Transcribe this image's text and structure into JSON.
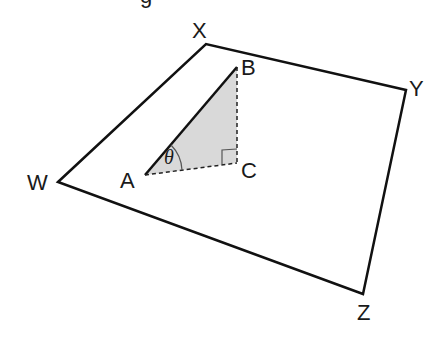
{
  "diagram": {
    "type": "geometry",
    "plane": {
      "vertices": {
        "W": {
          "label": "W",
          "x": 58,
          "y": 182
        },
        "X": {
          "label": "X",
          "x": 206,
          "y": 44
        },
        "Y": {
          "label": "Y",
          "x": 406,
          "y": 90
        },
        "Z": {
          "label": "Z",
          "x": 363,
          "y": 294
        }
      }
    },
    "triangle": {
      "A": {
        "label": "A",
        "x": 145,
        "y": 175
      },
      "B": {
        "label": "B",
        "x": 237,
        "y": 67
      },
      "C": {
        "label": "C",
        "x": 237,
        "y": 163
      },
      "fill": "#d9d9d9",
      "angle_label": "θ",
      "right_angle_at": "C"
    },
    "line_color": "#111111",
    "top_fragment": "g"
  }
}
